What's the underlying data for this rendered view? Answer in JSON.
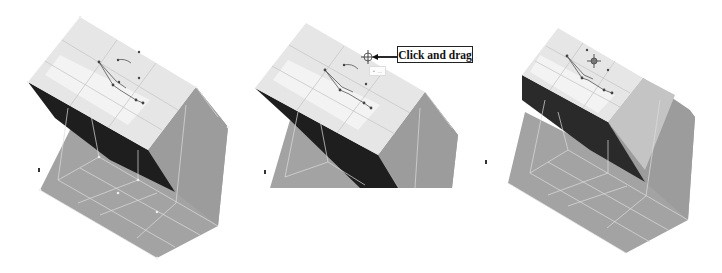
{
  "figure": {
    "panels": [
      {
        "id": "step-1",
        "state": "initial mesh with control curve visible"
      },
      {
        "id": "step-2",
        "state": "cursor on control point with callout",
        "callout_label": "Click and drag",
        "tooltip_text": "Unknown text (illegible)"
      },
      {
        "id": "step-3",
        "state": "surface deformed after dragging; move cursor icon shown"
      }
    ]
  },
  "callout": {
    "label": "Click and drag"
  },
  "tooltip": {
    "text": "•  ..."
  },
  "colors": {
    "top_face": "#e4e4e4",
    "top_face_highlight": "#f7f7f7",
    "side_face": "#9a9a9a",
    "bottom_face": "#a3a3a3",
    "dark_face": "#1e1e1e",
    "mesh_line": "#d6d6d6",
    "control_line": "#555555",
    "background": "#ffffff"
  }
}
